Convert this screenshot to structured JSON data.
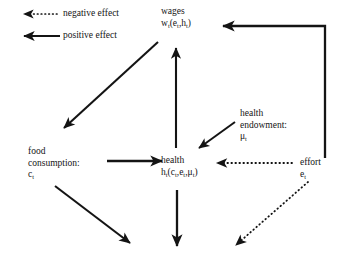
{
  "legend": {
    "negative": {
      "label": "negative effect",
      "style": "dotted"
    },
    "positive": {
      "label": "positive effect",
      "style": "solid"
    }
  },
  "nodes": {
    "wages": {
      "title": "wages",
      "symbol": "w",
      "symbol_sub": "t",
      "args": "(e",
      "args_sub1": "t",
      "args_mid": ",h",
      "args_sub2": "t",
      "args_end": ")"
    },
    "food": {
      "title_line1": "food",
      "title_line2": "consumption:",
      "symbol": "c",
      "symbol_sub": "t"
    },
    "health": {
      "title": "health",
      "symbol": "h",
      "symbol_sub": "t",
      "args": "(c",
      "args_sub1": "t",
      "args_mid": ",e",
      "args_sub2": "t",
      "args_mid2": ",μ",
      "args_sub3": "t",
      "args_end": ")"
    },
    "endowment": {
      "title_line1": "health",
      "title_line2": "endowment:",
      "symbol": "μ",
      "symbol_sub": "t"
    },
    "effort": {
      "title": "effort",
      "symbol": "e",
      "symbol_sub": "t"
    }
  },
  "edges": [
    {
      "name": "wages-to-food",
      "from": "wages",
      "to": "food",
      "effect": "positive"
    },
    {
      "name": "health-to-wages",
      "from": "health",
      "to": "wages",
      "effect": "positive"
    },
    {
      "name": "food-to-health",
      "from": "food",
      "to": "health",
      "effect": "positive"
    },
    {
      "name": "endowment-to-health",
      "from": "endowment",
      "to": "health",
      "effect": "positive"
    },
    {
      "name": "effort-to-health",
      "from": "effort",
      "to": "health",
      "effect": "negative"
    },
    {
      "name": "effort-to-wages",
      "from": "effort",
      "to": "wages",
      "effect": "positive"
    },
    {
      "name": "food-downward",
      "from": "food",
      "to": "below",
      "effect": "positive"
    },
    {
      "name": "health-downward",
      "from": "health",
      "to": "below",
      "effect": "positive"
    },
    {
      "name": "effort-downward",
      "from": "effort",
      "to": "below",
      "effect": "negative"
    }
  ],
  "colors": {
    "ink": "#141414",
    "background": "#ffffff"
  }
}
